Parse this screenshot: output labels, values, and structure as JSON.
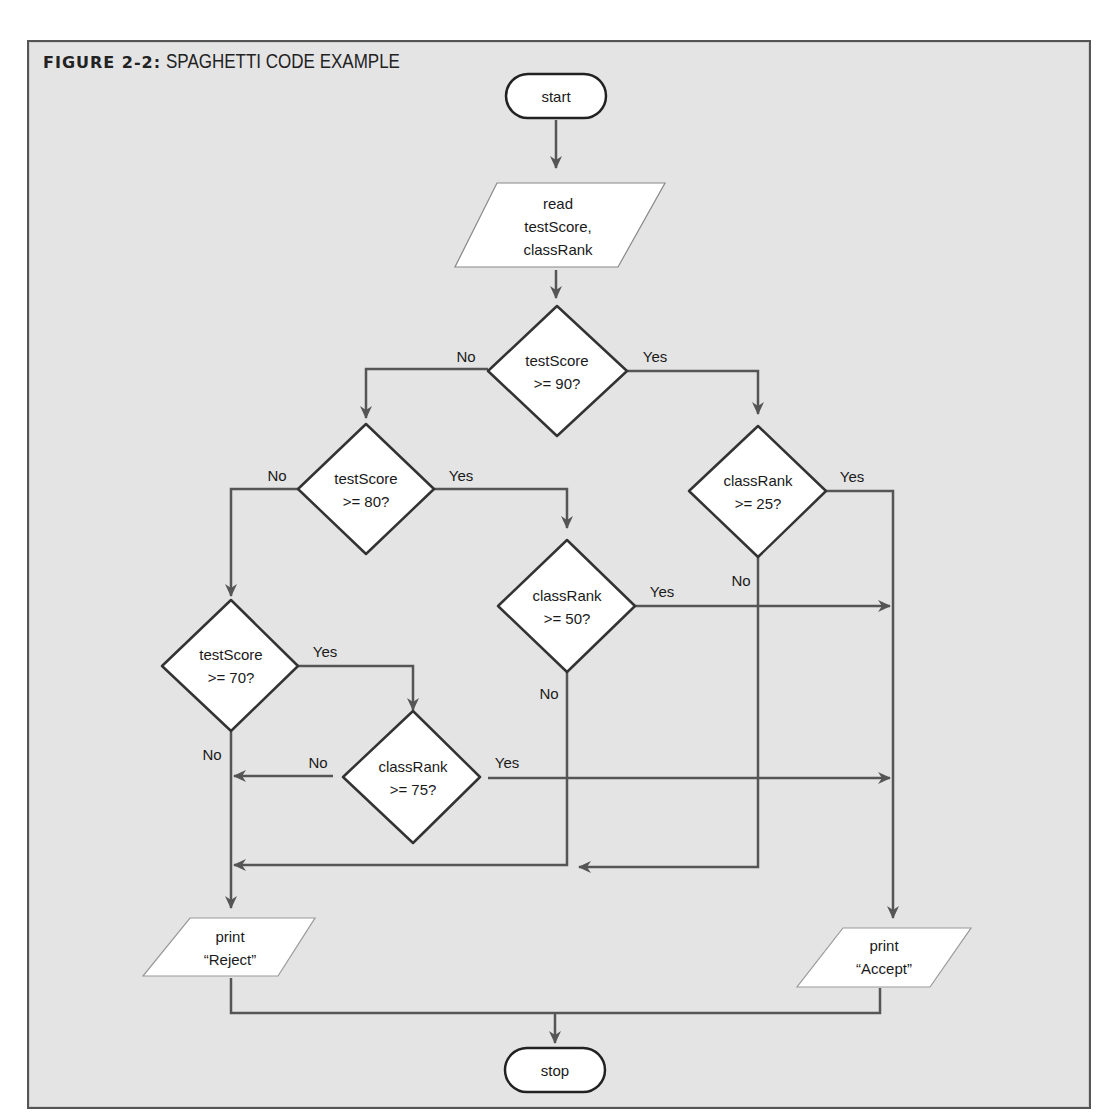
{
  "figure": {
    "label": "FIGURE 2-2:",
    "title": "SPAGHETTI CODE EXAMPLE"
  },
  "nodes": {
    "start": {
      "type": "terminator",
      "text": "start"
    },
    "read": {
      "type": "io",
      "lines": [
        "read",
        "testScore,",
        "classRank"
      ]
    },
    "d90": {
      "type": "decision",
      "lines": [
        "testScore",
        ">= 90?"
      ]
    },
    "d80": {
      "type": "decision",
      "lines": [
        "testScore",
        ">= 80?"
      ]
    },
    "r25": {
      "type": "decision",
      "lines": [
        "classRank",
        ">= 25?"
      ]
    },
    "r50": {
      "type": "decision",
      "lines": [
        "classRank",
        ">= 50?"
      ]
    },
    "d70": {
      "type": "decision",
      "lines": [
        "testScore",
        ">= 70?"
      ]
    },
    "r75": {
      "type": "decision",
      "lines": [
        "classRank",
        ">= 75?"
      ]
    },
    "reject": {
      "type": "io",
      "lines": [
        "print",
        "“Reject”"
      ]
    },
    "accept": {
      "type": "io",
      "lines": [
        "print",
        "“Accept”"
      ]
    },
    "stop": {
      "type": "terminator",
      "text": "stop"
    }
  },
  "edge_labels": {
    "d90_no": "No",
    "d90_yes": "Yes",
    "d80_no": "No",
    "d80_yes": "Yes",
    "r25_yes": "Yes",
    "r25_no": "No",
    "r50_yes": "Yes",
    "r50_no": "No",
    "d70_yes": "Yes",
    "d70_no": "No",
    "r75_no": "No",
    "r75_yes": "Yes"
  },
  "colors": {
    "background": "#e4e4e4",
    "line": "#555555",
    "shape_fill": "#ffffff",
    "shape_stroke": "#333333",
    "text": "#1a1a1a"
  }
}
